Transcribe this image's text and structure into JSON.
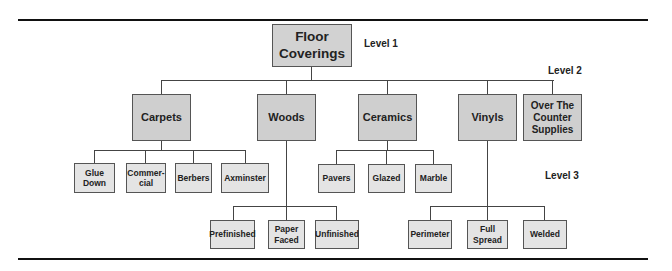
{
  "levels": {
    "level1": "Level 1",
    "level2": "Level 2",
    "level3": "Level 3"
  },
  "root": {
    "label": "Floor\nCoverings"
  },
  "categories": [
    {
      "label": "Carpets",
      "children": [
        "Glue\nDown",
        "Commer-\ncial",
        "Berbers",
        "Axminster"
      ]
    },
    {
      "label": "Woods",
      "children": [
        "Prefinished",
        "Paper\nFaced",
        "Unfinished"
      ]
    },
    {
      "label": "Ceramics",
      "children": [
        "Pavers",
        "Glazed",
        "Marble"
      ]
    },
    {
      "label": "Vinyls",
      "children": [
        "Perimeter",
        "Full\nSpread",
        "Welded"
      ]
    },
    {
      "label": "Over The\nCounter\nSupplies",
      "children": []
    }
  ]
}
